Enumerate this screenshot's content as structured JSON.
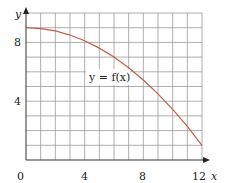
{
  "chart_data": {
    "type": "line",
    "title": "",
    "xlabel": "x",
    "ylabel": "y",
    "xlim": [
      0,
      12
    ],
    "ylim": [
      0,
      10
    ],
    "grid": true,
    "x_ticks": [
      0,
      4,
      8,
      12
    ],
    "y_ticks": [
      4,
      8
    ],
    "x_tick_labels": [
      "0",
      "4",
      "8",
      "12"
    ],
    "y_tick_labels": [
      "4",
      "8"
    ],
    "annotations": [
      {
        "text": "y = f(x)",
        "x": 5,
        "y": 6.2
      }
    ],
    "series": [
      {
        "name": "y = f(x)",
        "color": "#c0604a",
        "x": [
          0,
          1,
          2,
          3,
          4,
          5,
          6,
          7,
          8,
          9,
          10,
          11,
          12
        ],
        "y": [
          9.0,
          8.94,
          8.78,
          8.5,
          8.11,
          7.61,
          7.0,
          6.28,
          5.44,
          4.5,
          3.44,
          2.28,
          1.0
        ]
      }
    ]
  },
  "labels": {
    "origin": "0",
    "x4": "4",
    "x8": "8",
    "x12": "12",
    "y4": "4",
    "y8": "8",
    "x_axis": "x",
    "y_axis": "y",
    "curve": "y = f(x)"
  },
  "colors": {
    "grid": "#9a9a9a",
    "axis": "#333333",
    "curve": "#c0604a"
  }
}
